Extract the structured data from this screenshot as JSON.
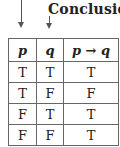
{
  "annotation": {
    "label": "Conclusion"
  },
  "table": {
    "headers": [
      "p",
      "q",
      "p → q"
    ],
    "rows": [
      [
        "T",
        "T",
        "T"
      ],
      [
        "T",
        "F",
        "F"
      ],
      [
        "F",
        "T",
        "T"
      ],
      [
        "F",
        "F",
        "T"
      ]
    ]
  }
}
